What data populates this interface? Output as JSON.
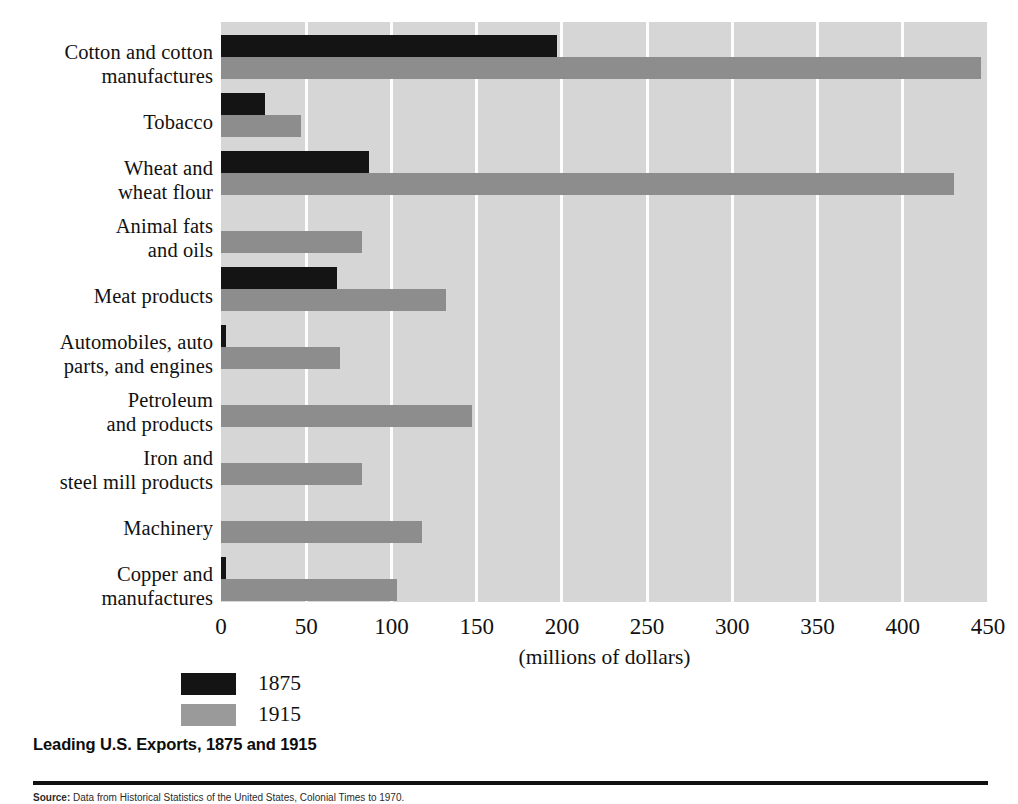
{
  "chart_data": {
    "type": "bar",
    "orientation": "horizontal",
    "title": "Leading U.S. Exports, 1875 and 1915",
    "xlabel": "(millions of dollars)",
    "ylabel": "",
    "xlim": [
      0,
      450
    ],
    "xticks": [
      0,
      50,
      100,
      150,
      200,
      250,
      300,
      350,
      400,
      450
    ],
    "xtick_labels": [
      "0",
      "50",
      "100",
      "150",
      "200",
      "250",
      "300",
      "350",
      "400",
      "450"
    ],
    "grid": "vertical-white-gridlines",
    "legend_position": "below-axis-left",
    "categories": [
      "Cotton and cotton\nmanufactures",
      "Tobacco",
      "Wheat and\nwheat flour",
      "Animal fats\nand oils",
      "Meat products",
      "Automobiles, auto\nparts, and engines",
      "Petroleum\nand products",
      "Iron and\nsteel mill products",
      "Machinery",
      "Copper and\nmanufactures"
    ],
    "series": [
      {
        "name": "1875",
        "color": "#141414",
        "values": [
          197,
          26,
          87,
          0,
          68,
          3,
          0,
          0,
          0,
          3
        ]
      },
      {
        "name": "1915",
        "color": "#8d8d8d",
        "values": [
          446,
          47,
          430,
          83,
          132,
          70,
          147,
          83,
          118,
          103
        ]
      }
    ]
  },
  "axis": {
    "x_title": "(millions of dollars)"
  },
  "legend": {
    "entries": [
      {
        "label": "1875",
        "swatch": "black"
      },
      {
        "label": "1915",
        "swatch": "gray"
      }
    ]
  },
  "caption": {
    "title": "Leading U.S. Exports, 1875 and 1915",
    "source_lead": "Source:",
    "source_text": "Data from Historical Statistics of the United States, Colonial Times to 1970."
  },
  "colors": {
    "plot_background": "#d6d6d6",
    "gridline": "#fdfdfd",
    "series_1875": "#141414",
    "series_1915": "#8d8d8d",
    "text": "#111111",
    "rule": "#111111"
  }
}
